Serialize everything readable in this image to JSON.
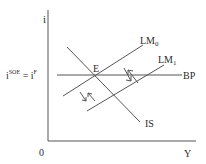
{
  "diagram": {
    "title": "",
    "axes": {
      "y_label": "i",
      "x_label": "Y",
      "origin_label": "0"
    },
    "rate_label": {
      "left": "i",
      "left_sup": "SOE",
      "equals": " = i",
      "right_sup": "F"
    },
    "curves": {
      "bp": "BP",
      "is": "IS",
      "lm0_base": "LM",
      "lm0_sub": "0",
      "lm1_base": "LM",
      "lm1_sub": "1"
    },
    "equilibrium_label": "E",
    "colors": {
      "line": "#555555",
      "text": "#2a2a2a"
    }
  }
}
